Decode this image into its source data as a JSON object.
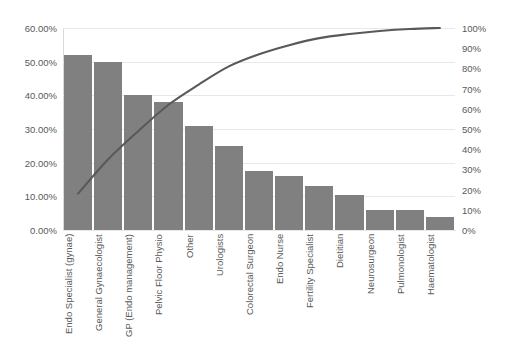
{
  "chart_data": {
    "type": "bar",
    "title": "",
    "subtitle": "",
    "xlabel": "",
    "ylabel": "",
    "grid": true,
    "legend": false,
    "categories": [
      "Endo Specialist (gynae)",
      "General Gynaecologist",
      "GP (Endo management)",
      "Pelvic Floor Physio",
      "Other",
      "Urologists",
      "Colorectal Surgeon",
      "Endo Nurse",
      "Fertility Specialist",
      "Dietitian",
      "Neurosurgeon",
      "Pulmonologist",
      "Haematologist"
    ],
    "series": [
      {
        "name": "Percentage",
        "type": "bar",
        "axis": "left",
        "values": [
          52.0,
          50.0,
          40.0,
          38.0,
          31.0,
          25.0,
          17.5,
          16.0,
          13.0,
          10.5,
          6.0,
          6.0,
          4.0
        ]
      },
      {
        "name": "Cumulative",
        "type": "line",
        "axis": "right",
        "values": [
          18.0,
          35.0,
          49.0,
          62.0,
          72.0,
          81.0,
          87.0,
          91.5,
          95.0,
          97.0,
          98.5,
          99.5,
          100.0
        ]
      }
    ],
    "left_axis": {
      "min": 0,
      "max": 60,
      "step": 10,
      "ticks": [
        "0.00%",
        "10.00%",
        "20.00%",
        "30.00%",
        "40.00%",
        "50.00%",
        "60.00%"
      ]
    },
    "right_axis": {
      "min": 0,
      "max": 100,
      "step": 10,
      "ticks": [
        "0%",
        "10%",
        "20%",
        "30%",
        "40%",
        "50%",
        "60%",
        "70%",
        "80%",
        "90%",
        "100%"
      ]
    },
    "colors": {
      "bar": "#808080",
      "line": "#595959",
      "grid": "#e8e8e8",
      "text": "#595959",
      "background": "#ffffff"
    }
  }
}
